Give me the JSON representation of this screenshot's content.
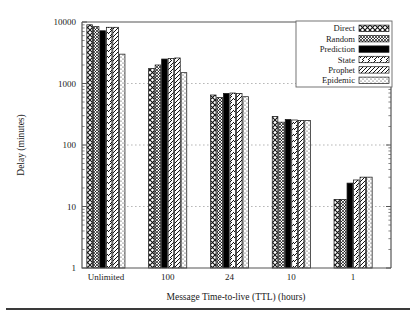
{
  "chart_data": {
    "type": "bar",
    "title": "",
    "subtitle": "",
    "xlabel": "Message Time-to-live (TTL) (hours)",
    "ylabel": "Delay (minutes)",
    "yscale": "log",
    "ylim": [
      1,
      10000
    ],
    "ytick_labels": [
      "1",
      "10",
      "100",
      "1000",
      "10000"
    ],
    "ytick_values": [
      1,
      10,
      100,
      1000,
      10000
    ],
    "grid": true,
    "grid_axis": "y",
    "legend_position": "top-right",
    "categories": [
      "Unlimited",
      "100",
      "24",
      "10",
      "1"
    ],
    "series": [
      {
        "name": "Direct",
        "pattern": "crosshatch",
        "values": [
          9000,
          1750,
          650,
          290,
          13
        ]
      },
      {
        "name": "Random",
        "pattern": "dense-dots",
        "values": [
          8400,
          2000,
          590,
          235,
          13
        ]
      },
      {
        "name": "Prediction",
        "pattern": "solid",
        "values": [
          7200,
          2500,
          690,
          260,
          24
        ]
      },
      {
        "name": "State",
        "pattern": "diagonal",
        "values": [
          8200,
          2550,
          700,
          255,
          27
        ]
      },
      {
        "name": "Prophet",
        "pattern": "diagonal-dense",
        "values": [
          8200,
          2600,
          690,
          250,
          30
        ]
      },
      {
        "name": "Epidemic",
        "pattern": "light-dots",
        "values": [
          3000,
          1500,
          610,
          250,
          30
        ]
      }
    ]
  },
  "legend": {
    "items": [
      {
        "label": "Direct"
      },
      {
        "label": "Random"
      },
      {
        "label": "Prediction"
      },
      {
        "label": "State"
      },
      {
        "label": "Prophet"
      },
      {
        "label": "Epidemic"
      }
    ]
  },
  "colors": {
    "axis": "#555555",
    "grid": "#9a9a9a",
    "bar_stroke": "#1a1a1a",
    "bar_fill": "#ffffff",
    "solid_fill": "#000000",
    "rule": "#3a3a3a"
  }
}
